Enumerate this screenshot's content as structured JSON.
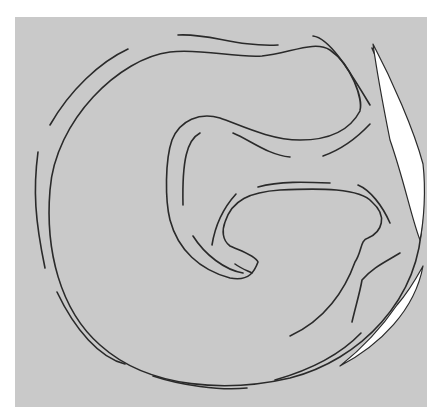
{
  "figure": {
    "colors": {
      "background": "#ffffff",
      "panel": "#c9c9c9",
      "line": "#2a2a2a",
      "crescent": "#ffffff"
    },
    "panel": {
      "x": 15,
      "y": 17,
      "width": 412,
      "height": 390
    },
    "outer_ring": {
      "solid": "M 372 48 C 395 100 425 170 422 220 C 420 300 360 360 290 378 C 230 392 150 390 100 345 C 60 310 45 250 50 190 C 55 120 120 58 170 52 C 200 48 235 58 262 56 C 290 53 315 40 330 50 C 352 65 363 100 360 110",
      "dashes": [
        "M 128 49 C 100 62 70 90 50 125",
        "M 38 152 C 33 190 35 220 45 268",
        "M 57 292 C 75 330 100 358 125 364",
        "M 153 376 C 180 385 220 391 247 388",
        "M 275 380 C 310 370 340 355 361 333",
        "M 178 35 C 210 33 235 47 278 45",
        "M 313 36 C 330 38 350 72 370 105"
      ]
    },
    "crescent": {
      "path": "M 373 44 C 392 80 414 130 423 164 C 426 190 424 220 420 240 C 412 220 404 180 390 140 C 384 110 378 80 373 44 Z"
    },
    "crescent_lower": {
      "path": "M 423 266 C 415 310 380 345 340 366 C 360 350 380 330 397 305 C 410 290 418 275 423 266 Z"
    },
    "inner_g": {
      "solid": "M 360 111 C 350 130 330 140 300 140 C 270 140 240 125 220 118 C 200 112 180 120 172 140 C 165 160 165 200 170 220 C 178 250 200 270 230 278 C 250 282 255 270 258 262 C 255 255 238 250 230 246 C 222 240 222 230 225 222 C 232 200 250 192 280 190 C 320 188 360 188 372 202 C 388 216 382 232 368 238 C 360 240 362 252 355 262 C 345 290 325 320 290 336",
      "dashes": [
        "M 233 133 C 250 140 268 155 290 157",
        "M 323 156 C 340 150 355 140 370 124",
        "M 200 133 C 187 140 182 160 183 205",
        "M 193 236 C 205 255 225 270 243 273",
        "M 235 264 C 240 268 248 271 252 273",
        "M 236 194 C 226 205 216 220 212 245",
        "M 258 187 C 280 181 305 182 330 183",
        "M 358 185 C 370 190 382 205 390 223",
        "M 400 253 C 385 262 372 268 362 280 C 360 292 356 305 352 322"
      ]
    },
    "labels": []
  }
}
